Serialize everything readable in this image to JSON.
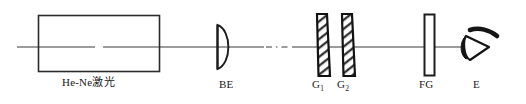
{
  "figure": {
    "type": "optical-setup-diagram",
    "background_color": "#ffffff",
    "line_color": "#2b2b2b",
    "width": 526,
    "height": 104,
    "optical_axis": {
      "y": 47,
      "x_start": 17,
      "x_end": 478,
      "break_style": "dash-dot"
    }
  },
  "components": {
    "laser": {
      "label": "He-Ne激光",
      "name": "he-ne-laser-source",
      "shape": "rectangle",
      "x": 38,
      "y": 15,
      "width": 122,
      "height": 57
    },
    "beam_expander": {
      "label": "BE",
      "name": "beam-expander-lens",
      "shape": "plano-convex-lens",
      "x": 218,
      "y": 25,
      "height": 44
    },
    "grating_1": {
      "label": "G",
      "subscript": "1",
      "name": "grating-one",
      "shape": "tilted-hatched-plate",
      "x": 317,
      "y": 14,
      "height": 62
    },
    "grating_2": {
      "label": "G",
      "subscript": "2",
      "name": "grating-two",
      "shape": "tilted-hatched-plate",
      "x": 342,
      "y": 14,
      "height": 62
    },
    "frosted_glass": {
      "label": "FG",
      "name": "frosted-glass-plate",
      "shape": "rectangle",
      "x": 424,
      "y": 14,
      "width": 11,
      "height": 62
    },
    "eye": {
      "label": "E",
      "name": "observer-eye",
      "shape": "eye-symbol",
      "x": 478,
      "y": 47
    }
  }
}
